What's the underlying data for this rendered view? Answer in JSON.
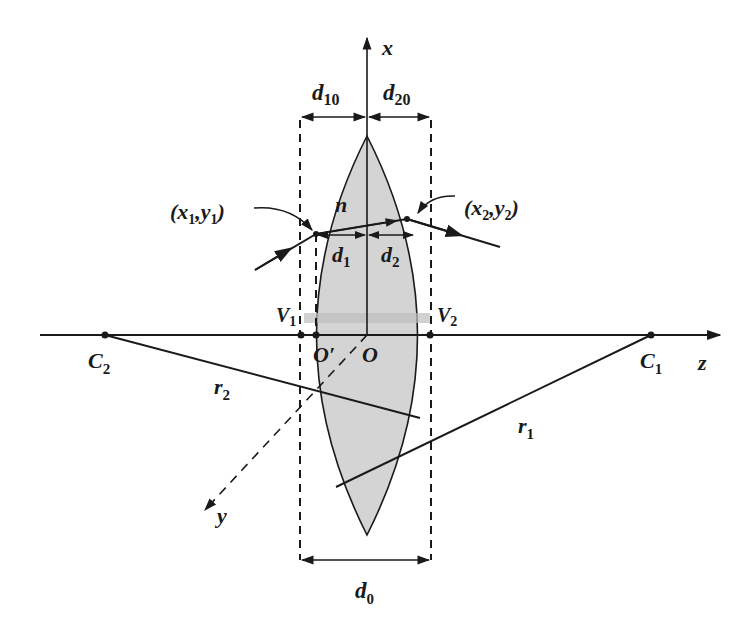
{
  "colors": {
    "ink": "#1a1a1a",
    "lens_fill": "#d4d4d4",
    "axis_shade": "#bdbdbd",
    "background": "#ffffff"
  },
  "labels": {
    "x_axis": {
      "main": "x",
      "sub": ""
    },
    "y_axis": {
      "main": "y",
      "sub": ""
    },
    "z_axis": {
      "main": "z",
      "sub": ""
    },
    "d10": {
      "main": "d",
      "sub": "10"
    },
    "d20": {
      "main": "d",
      "sub": "20"
    },
    "d1": {
      "main": "d",
      "sub": "1"
    },
    "d2": {
      "main": "d",
      "sub": "2"
    },
    "d0": {
      "main": "d",
      "sub": "0"
    },
    "n": {
      "main": "n",
      "sub": ""
    },
    "V1": {
      "main": "V",
      "sub": "1"
    },
    "V2": {
      "main": "V",
      "sub": "2"
    },
    "O_prime": {
      "main": "O′",
      "sub": ""
    },
    "O": {
      "main": "O",
      "sub": ""
    },
    "C1": {
      "main": "C",
      "sub": "1"
    },
    "C2": {
      "main": "C",
      "sub": "2"
    },
    "r1": {
      "main": "r",
      "sub": "1"
    },
    "r2": {
      "main": "r",
      "sub": "2"
    },
    "point1": {
      "open": "(",
      "x": "x",
      "xsub": "1",
      "sep": ",",
      "y": "y",
      "ysub": "1",
      "close": ")"
    },
    "point2": {
      "open": "(",
      "x": "x",
      "xsub": "2",
      "sep": ",",
      "y": "y",
      "ysub": "2",
      "close": ")"
    }
  }
}
